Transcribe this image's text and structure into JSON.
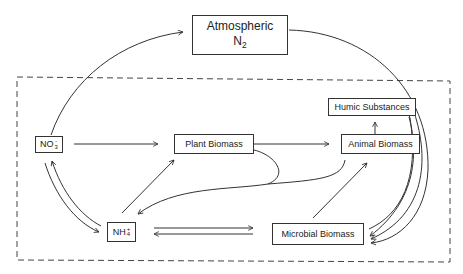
{
  "diagram": {
    "boundary": {
      "style": "dashed",
      "label": ""
    },
    "nodes": {
      "atmospheric_n2": {
        "line1": "Atmospheric",
        "line2_main": "N",
        "line2_sub": "2"
      },
      "nitrate": {
        "main": "NO",
        "sub": "3",
        "sup": "-"
      },
      "ammonium": {
        "main": "NH",
        "sub": "4",
        "sup": "+"
      },
      "plant_biomass": {
        "label": "Plant Biomass"
      },
      "animal_biomass": {
        "label": "Animal Biomass"
      },
      "humic_substances": {
        "label": "Humic Substances"
      },
      "microbial_biomass": {
        "label": "Microbial Biomass"
      }
    },
    "edges": [
      {
        "from": "NO3-",
        "to": "Atmospheric N2"
      },
      {
        "from": "Atmospheric N2",
        "to": "Microbial Biomass"
      },
      {
        "from": "NO3-",
        "to": "Plant Biomass"
      },
      {
        "from": "Plant Biomass",
        "to": "Animal Biomass"
      },
      {
        "from": "Animal Biomass",
        "to": "Humic Substances"
      },
      {
        "from": "NO3-",
        "to": "NH4+"
      },
      {
        "from": "NH4+",
        "to": "NO3-"
      },
      {
        "from": "NH4+",
        "to": "Plant Biomass"
      },
      {
        "from": "Plant Biomass",
        "to": "NH4+"
      },
      {
        "from": "Animal Biomass",
        "to": "NH4+"
      },
      {
        "from": "NH4+",
        "to": "Microbial Biomass"
      },
      {
        "from": "Microbial Biomass",
        "to": "NH4+"
      },
      {
        "from": "Microbial Biomass",
        "to": "Animal Biomass"
      },
      {
        "from": "Microbial Biomass",
        "to": "Humic Substances"
      },
      {
        "from": "Humic Substances",
        "to": "Microbial Biomass"
      },
      {
        "from": "Animal Biomass",
        "to": "Microbial Biomass"
      }
    ],
    "colors": {
      "line": "#333333",
      "background": "#ffffff"
    }
  }
}
